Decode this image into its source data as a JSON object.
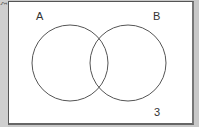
{
  "diagram": {
    "type": "venn",
    "universal_symbol": "ξ",
    "sets": [
      {
        "label": "A",
        "cx": 70,
        "cy": 63,
        "r": 38
      },
      {
        "label": "B",
        "cx": 128,
        "cy": 63,
        "r": 38
      }
    ],
    "outside_value": "3",
    "colors": {
      "line": "#555555",
      "background": "#ffffff",
      "border": "#c8c8c8"
    }
  }
}
